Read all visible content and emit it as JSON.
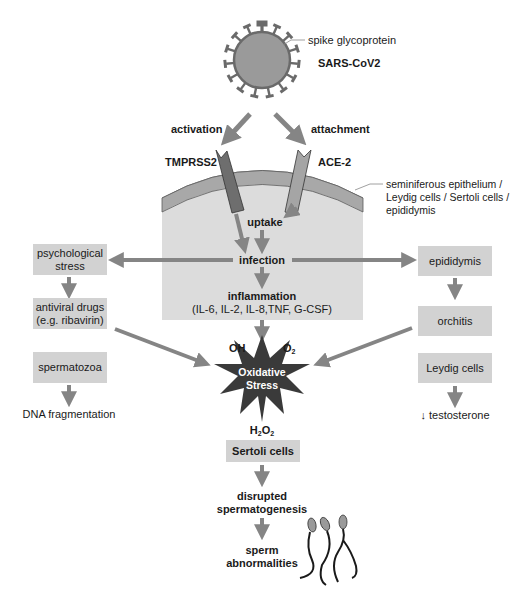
{
  "virus": {
    "spike_label": "spike glycoprotein",
    "name": "SARS-CoV2"
  },
  "entry": {
    "activation_label": "activation",
    "attachment_label": "attachment",
    "receptor_left": "TMPRSS2",
    "receptor_right": "ACE-2",
    "tissue_label_lines": [
      "seminiferous epithelium /",
      "Leydig cells / Sertoli cells /",
      "epididymis"
    ],
    "uptake_label": "uptake",
    "infection_label": "infection",
    "inflammation_label": "inflammation",
    "cytokines_label": "(IL-6, IL-2, IL-8,TNF, G-CSF)"
  },
  "left_branch": {
    "boxes": [
      {
        "lines": [
          "psychological",
          "stress"
        ]
      },
      {
        "lines": [
          "antiviral drugs",
          "(e.g. ribavirin)"
        ]
      },
      {
        "lines": [
          "spermatozoa"
        ]
      }
    ],
    "outcome": "DNA fragmentation"
  },
  "right_branch": {
    "boxes": [
      {
        "lines": [
          "epididymis"
        ]
      },
      {
        "lines": [
          "orchitis"
        ]
      },
      {
        "lines": [
          "Leydig cells"
        ]
      }
    ],
    "outcome": "↓ testosterone"
  },
  "oxidative": {
    "lines": [
      "Oxidative",
      "Stress"
    ],
    "oh": "OH",
    "o2_base": "O",
    "o2_sub": "2",
    "h2o2_h": "H",
    "h2o2_sub1": "2",
    "h2o2_o": "O",
    "h2o2_sub2": "2"
  },
  "bottom_chain": {
    "sertoli": "Sertoli cells",
    "disrupted_lines": [
      "disrupted",
      "spermatogenesis"
    ],
    "abnormal_lines": [
      "sperm",
      "abnormalities"
    ]
  },
  "colors": {
    "arrow": "#858585",
    "box": "#d2d2d2",
    "cell": "#dcdcdc",
    "membrane": "#a8a8a8",
    "receptor_dark": "#6e6e6e",
    "receptor_light": "#a5a5a5",
    "star": "#3a3a3a",
    "virus": "#9a9a9a"
  }
}
